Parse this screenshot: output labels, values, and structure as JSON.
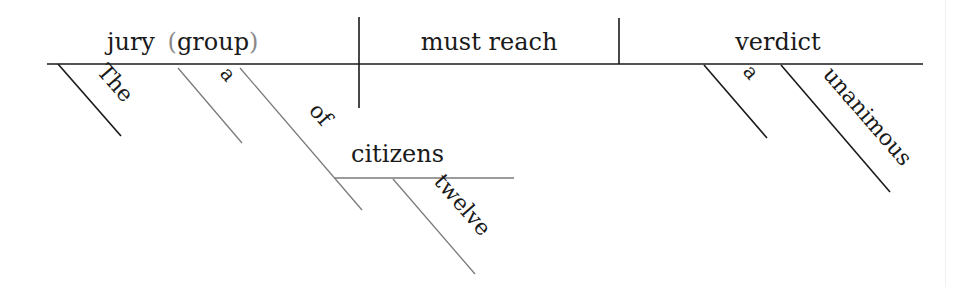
{
  "diagram": {
    "type": "sentence-diagram",
    "sentence": "The jury, a group of twelve citizens, must reach a unanimous verdict.",
    "subject": {
      "word": "jury",
      "appositive_open": "(",
      "appositive": "group",
      "appositive_close": ")",
      "modifiers": [
        {
          "word": "The",
          "attaches_to": "jury"
        },
        {
          "word": "a",
          "attaches_to": "group"
        }
      ],
      "prepositional_phrase": {
        "preposition": "of",
        "object": "citizens",
        "object_modifiers": [
          {
            "word": "twelve",
            "attaches_to": "citizens"
          }
        ]
      }
    },
    "verb": {
      "phrase": "must reach"
    },
    "direct_object": {
      "word": "verdict",
      "modifiers": [
        {
          "word": "a",
          "attaches_to": "verdict"
        },
        {
          "word": "unanimous",
          "attaches_to": "verdict"
        }
      ]
    },
    "colors": {
      "main_line": "#1a1a1a",
      "secondary_line": "#7a7a7a",
      "parenthesis": "#8a8a8a",
      "background": "#ffffff"
    }
  }
}
